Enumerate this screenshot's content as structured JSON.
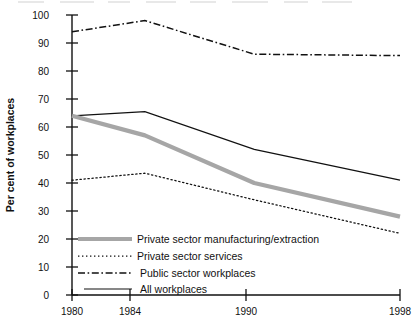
{
  "chart_data": {
    "type": "line",
    "title": "",
    "subtitle": "",
    "xlabel": "",
    "ylabel": "Per cent of workplaces",
    "categories": [
      "1980",
      "1984",
      "1990",
      "1998"
    ],
    "x": [
      1980,
      1984,
      1990,
      1998
    ],
    "xlim": [
      1980,
      1998
    ],
    "ylim": [
      0,
      100
    ],
    "ytick_labels": [
      "0",
      "10",
      "20",
      "30",
      "40",
      "50",
      "60",
      "70",
      "80",
      "90",
      "100"
    ],
    "ytick_values": [
      0,
      10,
      20,
      30,
      40,
      50,
      60,
      70,
      80,
      90,
      100
    ],
    "xtick_labels": [
      "1980",
      "1984",
      "1990",
      "1998"
    ],
    "grid": false,
    "legend_position": "lower-left-inside",
    "series": [
      {
        "name": "Private sector manufacturing/extraction",
        "style": "thick-solid-gray",
        "color": "#a6a6a6",
        "values": [
          64,
          57,
          40,
          28
        ]
      },
      {
        "name": "Private sector services",
        "style": "dotted",
        "color": "#111111",
        "values": [
          41,
          43.5,
          34,
          22
        ]
      },
      {
        "name": "Public sector workplaces",
        "style": "dash-dot",
        "color": "#111111",
        "values": [
          94,
          98,
          86,
          85.5
        ]
      },
      {
        "name": "All workplaces",
        "style": "thin-solid",
        "color": "#111111",
        "values": [
          64,
          65.5,
          52,
          41
        ]
      }
    ]
  },
  "axes": {
    "y_label": "Per cent of workplaces",
    "y_ticks": [
      "100",
      "90",
      "80",
      "70",
      "60",
      "50",
      "40",
      "30",
      "20",
      "10",
      "0"
    ],
    "x_ticks": [
      "1980",
      "1984",
      "1990",
      "1998"
    ]
  },
  "legend": {
    "items": [
      {
        "label": "Private sector manufacturing/extraction",
        "marker": "thick-gray-line-marker"
      },
      {
        "label": "Private sector services",
        "marker": "dotted-line-marker"
      },
      {
        "label": "Public sector workplaces",
        "marker": "dash-dot-line-marker"
      },
      {
        "label": "All workplaces",
        "marker": "solid-line-marker"
      }
    ]
  }
}
